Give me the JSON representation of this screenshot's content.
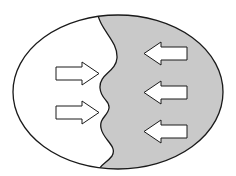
{
  "diagram": {
    "type": "ellipse-with-wavy-boundary",
    "colors": {
      "background": "#ffffff",
      "left_region_fill": "#ffffff",
      "right_region_fill": "#c9c9c9",
      "stroke": "#1a1a1a",
      "arrow_fill": "#ffffff"
    },
    "ellipse": {
      "cx": 118,
      "cy": 92,
      "rx": 105,
      "ry": 77
    },
    "left_arrows": [
      {
        "direction": "right",
        "y": 73
      },
      {
        "direction": "right",
        "y": 112
      }
    ],
    "right_arrows": [
      {
        "direction": "left",
        "y": 53
      },
      {
        "direction": "left",
        "y": 92
      },
      {
        "direction": "left",
        "y": 131
      }
    ]
  }
}
